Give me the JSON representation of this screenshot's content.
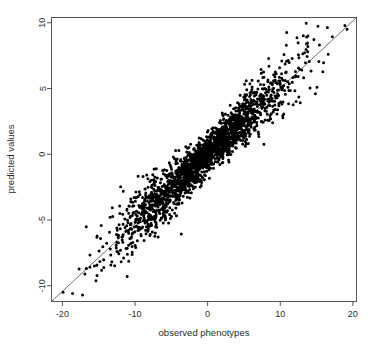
{
  "chart_data": {
    "type": "scatter",
    "title": "",
    "xlabel": "observed phenotypes",
    "ylabel": "predicted values",
    "xlim": [
      -21.5,
      20.5
    ],
    "ylim": [
      -11.2,
      10.4
    ],
    "xticks": [
      -20,
      -10,
      0,
      10,
      20
    ],
    "yticks": [
      -10,
      -5,
      0,
      5,
      10
    ],
    "xtick_labels": [
      "-20",
      "-10",
      "0",
      "10",
      "20"
    ],
    "ytick_labels": [
      "-10",
      "-5",
      "0",
      "5",
      "10"
    ],
    "grid": false,
    "legend": null,
    "point_color": "#000000",
    "point_size": 2.1,
    "box_color": "#555555",
    "reference_line": {
      "name": "identity-line",
      "color": "#6e6e6e",
      "width": 1,
      "x0": -21.5,
      "y0": -11.2,
      "x1": 20.5,
      "y1": 10.4
    },
    "n_points": 2100,
    "series": [
      {
        "name": "predicted vs observed",
        "color": "#000000",
        "regression_slope": 0.515,
        "regression_intercept": 0.0,
        "x_mean": -0.4,
        "x_sd": 5.6,
        "residual_sd": 0.95,
        "outliers": [
          [
            -19.9,
            -10.5
          ],
          [
            -18.6,
            -10.6
          ],
          [
            -16.9,
            -9.1
          ],
          [
            -16.2,
            -8.6
          ],
          [
            -15.6,
            -8.5
          ],
          [
            -13.4,
            -7.2
          ],
          [
            -12.0,
            -7.3
          ],
          [
            -9.9,
            -7.1
          ],
          [
            16.6,
            7.6
          ],
          [
            15.4,
            8.3
          ],
          [
            13.8,
            8.2
          ],
          [
            19.2,
            9.5
          ],
          [
            18.9,
            9.8
          ]
        ]
      }
    ]
  },
  "axes": {
    "xlabel": "observed phenotypes",
    "ylabel": "predicted values"
  }
}
